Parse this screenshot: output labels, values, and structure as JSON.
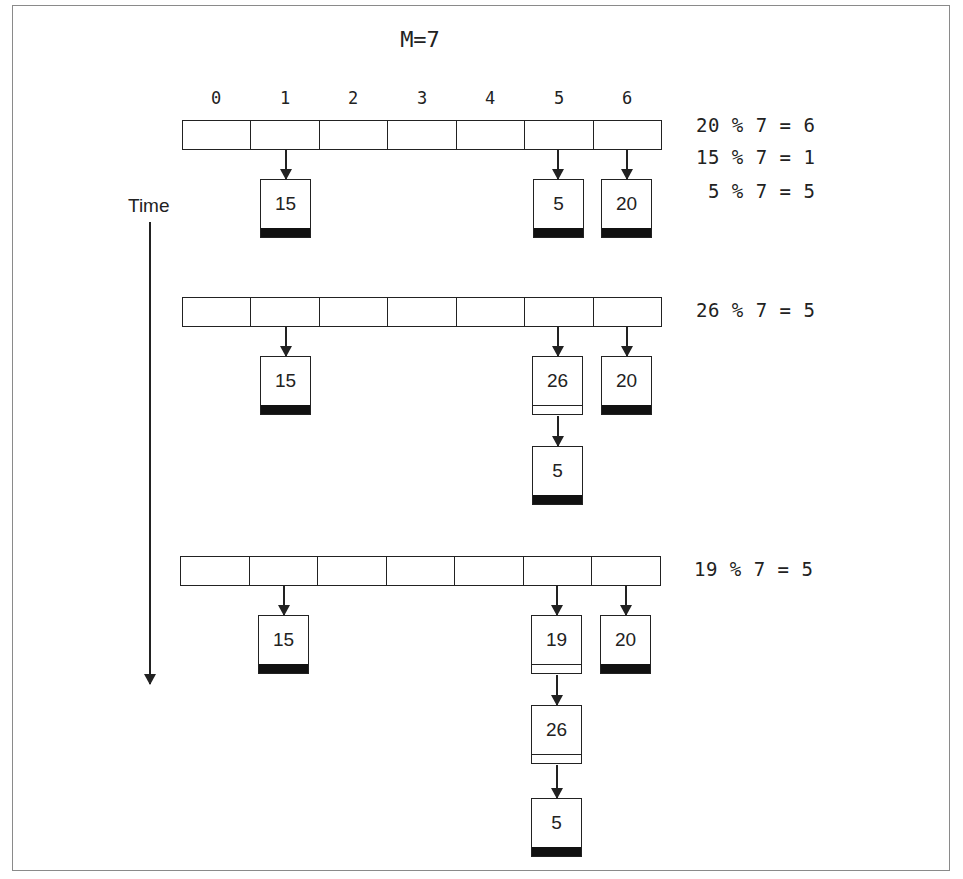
{
  "diagram": {
    "title": "M=7",
    "time_label": "Time",
    "indices": [
      "0",
      "1",
      "2",
      "3",
      "4",
      "5",
      "6"
    ],
    "stages": [
      {
        "formulas": [
          "20 % 7 = 6",
          "15 % 7 = 1",
          " 5 % 7 = 5"
        ],
        "buckets": {
          "1": [
            "15"
          ],
          "5": [
            "5"
          ],
          "6": [
            "20"
          ]
        }
      },
      {
        "formulas": [
          "26 % 7 = 5"
        ],
        "buckets": {
          "1": [
            "15"
          ],
          "5": [
            "26",
            "5"
          ],
          "6": [
            "20"
          ]
        }
      },
      {
        "formulas": [
          "19 % 7 = 5"
        ],
        "buckets": {
          "1": [
            "15"
          ],
          "5": [
            "19",
            "26",
            "5"
          ],
          "6": [
            "20"
          ]
        }
      }
    ]
  },
  "colors": {
    "line": "#222222",
    "frame": "#8a8a8a",
    "null_pointer": "#111111",
    "background": "#ffffff"
  }
}
